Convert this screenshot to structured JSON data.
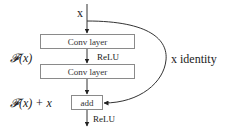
{
  "diagram": {
    "type": "residual-block",
    "input_label": "x",
    "nodes": [
      {
        "id": "conv1",
        "label": "Conv layer"
      },
      {
        "id": "conv2",
        "label": "Conv layer"
      },
      {
        "id": "add",
        "label": "add"
      }
    ],
    "activations": {
      "between_convs": "ReLU",
      "after_add": "ReLU"
    },
    "annotations": {
      "fx": "𝓕(x)",
      "fx_plus_x": "𝓕(x) + x",
      "identity": "x identity"
    },
    "edges": [
      {
        "from": "input",
        "to": "conv1"
      },
      {
        "from": "conv1",
        "to": "conv2",
        "label": "ReLU"
      },
      {
        "from": "conv2",
        "to": "add"
      },
      {
        "from": "input",
        "to": "add",
        "label": "x identity",
        "style": "curved-skip"
      },
      {
        "from": "add",
        "to": "output",
        "label": "ReLU"
      }
    ],
    "colors": {
      "line": "#333333",
      "box_border": "#8a8a8a",
      "text": "#222222"
    }
  }
}
